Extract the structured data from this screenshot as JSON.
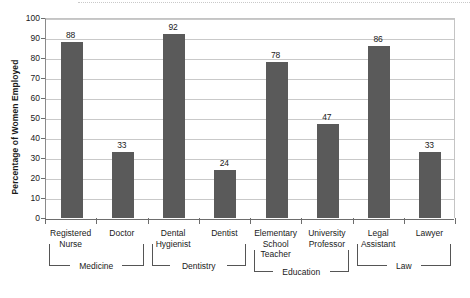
{
  "chart_data": {
    "type": "bar",
    "title": "",
    "xlabel": "",
    "ylabel": "Percentage of Women Employed",
    "ylim": [
      0,
      100
    ],
    "ytick_step": 10,
    "yticks": [
      "100",
      "90",
      "80",
      "70",
      "60",
      "50",
      "40",
      "30",
      "20",
      "10",
      "0"
    ],
    "grid": true,
    "legend": "none",
    "bar_color": "#5a5a5a",
    "categories": [
      "Registered Nurse",
      "Doctor",
      "Dental Hygienist",
      "Dentist",
      "Elementary School Teacher",
      "University Professor",
      "Legal Assistant",
      "Lawyer"
    ],
    "category_lines": [
      [
        "Registered",
        "Nurse"
      ],
      [
        "Doctor"
      ],
      [
        "Dental",
        "Hygienist"
      ],
      [
        "Dentist"
      ],
      [
        "Elementary",
        "School",
        "Teacher"
      ],
      [
        "University",
        "Professor"
      ],
      [
        "Legal",
        "Assistant"
      ],
      [
        "Lawyer"
      ]
    ],
    "values": [
      88,
      33,
      92,
      24,
      78,
      47,
      86,
      33
    ],
    "groups": [
      {
        "label": "Medicine",
        "first": 0,
        "last": 1
      },
      {
        "label": "Dentistry",
        "first": 2,
        "last": 3
      },
      {
        "label": "Education",
        "first": 4,
        "last": 5
      },
      {
        "label": "Law",
        "first": 6,
        "last": 7
      }
    ]
  }
}
